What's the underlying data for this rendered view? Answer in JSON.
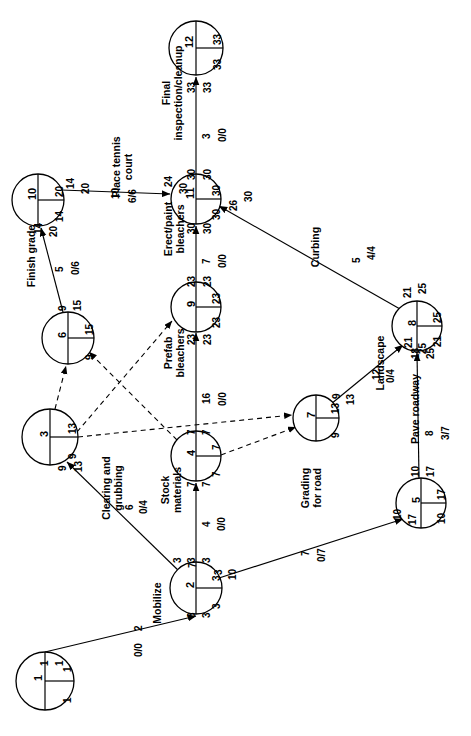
{
  "diagram": {
    "orientation": "rotated-90-ccw",
    "stroke_color": "#000000",
    "background_color": "#ffffff",
    "legend_note": "Each node circle shows: activity number (left half), early/late times (right quadrants). Arrow labels show early start / early finish, duration, and free float / total float."
  },
  "nodes": [
    {
      "id": "n1",
      "number": "1",
      "top_right": "1",
      "bottom_right": "1",
      "cx": 45,
      "cy": 681,
      "r": 29
    },
    {
      "id": "n2",
      "number": "2",
      "top_right": "3",
      "bottom_right": "3",
      "cx": 196,
      "cy": 588,
      "r": 26
    },
    {
      "id": "n3",
      "number": "3",
      "top_right": "13",
      "bottom_right": "9",
      "cx": 50,
      "cy": 437,
      "r": 28
    },
    {
      "id": "n4",
      "number": "4",
      "top_right": "7",
      "bottom_right": "7",
      "cx": 196,
      "cy": 456,
      "r": 25
    },
    {
      "id": "n5",
      "number": "5",
      "top_right": "17",
      "bottom_right": "10",
      "cx": 421,
      "cy": 503,
      "r": 25
    },
    {
      "id": "n6",
      "number": "6",
      "top_right": "15",
      "bottom_right": "9",
      "cx": 68,
      "cy": 338,
      "r": 26
    },
    {
      "id": "n7",
      "number": "7",
      "top_right": "13",
      "bottom_right": "9",
      "cx": 316,
      "cy": 418,
      "r": 23
    },
    {
      "id": "n8",
      "number": "8",
      "top_right": "25",
      "bottom_right": "21",
      "cx": 417,
      "cy": 326,
      "r": 25
    },
    {
      "id": "n9",
      "number": "9",
      "top_right": "23",
      "bottom_right": "23",
      "cx": 196,
      "cy": 307,
      "r": 25
    },
    {
      "id": "n10",
      "number": "10",
      "top_right": "20",
      "bottom_right": "14",
      "cx": 38,
      "cy": 200,
      "r": 26
    },
    {
      "id": "n11",
      "number": "11",
      "top_right": "30",
      "bottom_right": "30",
      "cx": 196,
      "cy": 199,
      "r": 25
    },
    {
      "id": "n12",
      "number": "12",
      "top_right": "33",
      "bottom_right": "33",
      "cx": 196,
      "cy": 48,
      "r": 27
    }
  ],
  "activities": [
    {
      "id": "a_mobilize",
      "name": "Mobilize",
      "from": "n1",
      "to": "n2",
      "duration": "2",
      "float": "0/0",
      "start_early": "1",
      "start_late": "1",
      "finish_early": "3",
      "finish_late": "3",
      "style": "solid"
    },
    {
      "id": "a_clearing",
      "name": "Clearing and\ngrubbing",
      "from": "n2",
      "to": "n3",
      "duration": "6",
      "float": "0/4",
      "start_early": "3",
      "start_late": "7",
      "finish_early": "9",
      "finish_late": "13",
      "style": "solid"
    },
    {
      "id": "a_stock",
      "name": "Stock\nmaterials",
      "from": "n2",
      "to": "n4",
      "duration": "4",
      "float": "0/0",
      "start_early": "3",
      "start_late": "3",
      "finish_early": "7",
      "finish_late": "7",
      "style": "solid"
    },
    {
      "id": "a_grading",
      "name": "Grading\nfor road",
      "from": "n2",
      "to": "n5",
      "duration": "7",
      "float": "0/7",
      "start_early": "3",
      "start_late": "10",
      "finish_early": "10",
      "finish_late": "17",
      "style": "solid"
    },
    {
      "id": "a_finish",
      "name": "Finish grade",
      "from": "n6",
      "to": "n10",
      "duration": "5",
      "float": "0/6",
      "start_early": "9",
      "start_late": "15",
      "finish_early": "14",
      "finish_late": "20",
      "style": "solid"
    },
    {
      "id": "a_tennis",
      "name": "Place tennis\ncourt",
      "from": "n10",
      "to": "n11",
      "duration": "10",
      "float": "6/6",
      "start_early": "14",
      "start_late": "20",
      "finish_early": "24",
      "finish_late": "30",
      "style": "solid"
    },
    {
      "id": "a_prefab",
      "name": "Prefab\nbleachers",
      "from": "n4",
      "to": "n9",
      "duration": "16",
      "float": "0/0",
      "start_early": "7",
      "start_late": "7",
      "finish_early": "23",
      "finish_late": "23",
      "style": "solid"
    },
    {
      "id": "a_erect",
      "name": "Erect/paint\nbleachers",
      "from": "n9",
      "to": "n11",
      "duration": "7",
      "float": "0/0",
      "start_early": "23",
      "start_late": "23",
      "finish_early": "30",
      "finish_late": "30",
      "style": "solid"
    },
    {
      "id": "a_final",
      "name": "Final\ninspection/cleanup",
      "from": "n11",
      "to": "n12",
      "duration": "3",
      "float": "0/0",
      "start_early": "30",
      "start_late": "30",
      "finish_early": "33",
      "finish_late": "33",
      "style": "solid"
    },
    {
      "id": "a_curbing",
      "name": "Curbing",
      "from": "n8",
      "to": "n11",
      "duration": "5",
      "float": "4/4",
      "start_early": "21",
      "start_late": "25",
      "finish_early": "26",
      "finish_late": "30",
      "style": "solid"
    },
    {
      "id": "a_landscape",
      "name": "Landscape",
      "from": "n7",
      "to": "n8",
      "duration": "12",
      "float": "0/4",
      "start_early": "9",
      "start_late": "13",
      "finish_early": "21",
      "finish_late": "25",
      "style": "solid"
    },
    {
      "id": "a_pave",
      "name": "Pave roadway",
      "from": "n5",
      "to": "n8",
      "duration": "8",
      "float": "3/7",
      "start_early": "10",
      "start_late": "17",
      "finish_early": "18",
      "finish_late": "25",
      "style": "solid"
    }
  ],
  "dummy_links": [
    {
      "id": "d_3_6",
      "from": "n3",
      "to": "n6",
      "style": "dashed"
    },
    {
      "id": "d_3_9",
      "from": "n3",
      "to": "n9",
      "style": "dashed"
    },
    {
      "id": "d_3_7",
      "from": "n3",
      "to": "n7",
      "style": "dashed"
    },
    {
      "id": "d_4_6",
      "from": "n4",
      "to": "n6",
      "style": "dashed"
    },
    {
      "id": "d_4_7",
      "from": "n4",
      "to": "n7",
      "style": "dashed"
    }
  ],
  "edge_labels": {
    "mobilize_es": "1",
    "mobilize_ls": "1",
    "mobilize_ef": "3",
    "mobilize_lf": "3",
    "clearing_es": "3",
    "clearing_ls": "7",
    "clearing_ef": "9",
    "clearing_lf": "13",
    "stock_es": "3",
    "stock_ls": "3",
    "stock_ef": "7",
    "stock_lf": "7",
    "grading_es": "3",
    "grading_ls": "10",
    "grading_ef": "10",
    "grading_lf": "17",
    "finish_es": "9",
    "finish_ls": "15",
    "finish_ef": "14",
    "finish_lf": "20",
    "tennis_es": "14",
    "tennis_ls": "20",
    "tennis_ef": "24",
    "tennis_lf": "30",
    "prefab_es": "7",
    "prefab_ls": "7",
    "prefab_ef": "23",
    "prefab_lf": "23",
    "erect_es": "23",
    "erect_ls": "23",
    "erect_ef": "30",
    "erect_lf": "30",
    "final_es": "30",
    "final_ls": "30",
    "final_ef": "33",
    "final_lf": "33",
    "curbing_es": "21",
    "curbing_ls": "25",
    "curbing_ef": "26",
    "curbing_lf": "30",
    "landscape_es": "9",
    "landscape_ls": "13",
    "landscape_ef": "21",
    "landscape_lf": "25",
    "pave_es": "10",
    "pave_ls": "17",
    "pave_ef": "18",
    "pave_lf": "25"
  }
}
